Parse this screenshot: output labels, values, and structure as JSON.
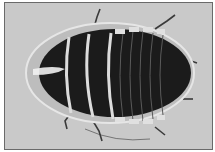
{
  "image": {
    "subject": "cockroach-dorsal-view",
    "background_color": "#c9c9c9",
    "body_color": "#1a1a1a",
    "segment_edge_color": "#d8d8d8"
  }
}
